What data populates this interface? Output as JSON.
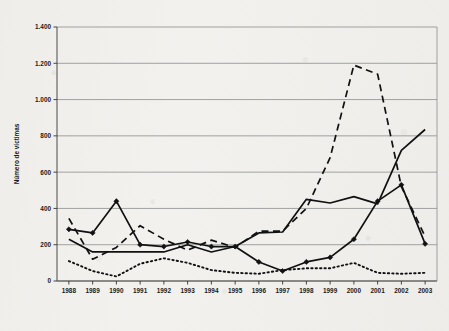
{
  "chart_data": {
    "type": "line",
    "title": "",
    "xlabel": "",
    "ylabel": "Número de víctimas",
    "ylim": [
      0,
      1400
    ],
    "ytick_labels": [
      "0",
      "200",
      "400",
      "600",
      "800",
      "1.000",
      "1.200",
      "1.400"
    ],
    "ytick_values": [
      0,
      200,
      400,
      600,
      800,
      1000,
      1200,
      1400
    ],
    "grid": "horizontal",
    "legend_position": "bottom",
    "categories": [
      "1988",
      "1989",
      "1990",
      "1991",
      "1992",
      "1993",
      "1994",
      "1995",
      "1996",
      "1997",
      "1998",
      "1999",
      "2000",
      "2001",
      "2002",
      "2003"
    ],
    "series": [
      {
        "name": "Guerrilla",
        "style": "solid",
        "values": [
          230,
          160,
          160,
          160,
          160,
          200,
          160,
          190,
          265,
          270,
          450,
          430,
          465,
          425,
          720,
          835
        ]
      },
      {
        "name": "Paramilitares",
        "style": "dashed",
        "values": [
          345,
          120,
          185,
          305,
          230,
          170,
          225,
          185,
          275,
          275,
          400,
          680,
          1190,
          1140,
          520,
          245
        ]
      },
      {
        "name": "Fuerzas estatales",
        "style": "dotted",
        "values": [
          110,
          55,
          25,
          95,
          125,
          100,
          60,
          45,
          40,
          60,
          70,
          70,
          100,
          45,
          40,
          45
        ]
      },
      {
        "name": "Otros",
        "style": "solid-marker",
        "values": [
          285,
          265,
          440,
          200,
          190,
          215,
          190,
          190,
          105,
          55,
          105,
          130,
          230,
          440,
          530,
          205
        ]
      }
    ]
  },
  "axis": {
    "y_title": "Número de víctimas"
  },
  "legend": {
    "items": [
      {
        "label": "Guerrilla",
        "style": "solid"
      },
      {
        "label": "Paramilitares",
        "style": "dashed"
      },
      {
        "label": "Fuerzas estatales",
        "style": "dotted"
      },
      {
        "label": "Otros",
        "style": "solid-marker"
      }
    ]
  }
}
